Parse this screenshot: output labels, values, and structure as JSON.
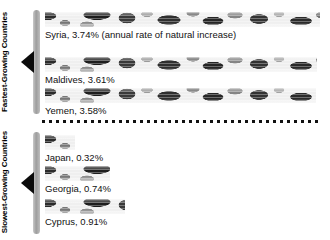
{
  "groups": [
    {
      "caption": "Fastest-Growing Countries"
    },
    {
      "caption": "Slowest-Growing Countries"
    }
  ],
  "rows": [
    {
      "label": "Syria, 3.74% (annual rate of natural increase)",
      "country": "Syria",
      "value": 3.74,
      "top": 12,
      "bar_width": 275
    },
    {
      "label": "Maldives, 3.61%",
      "country": "Maldives",
      "value": 3.61,
      "top": 57,
      "bar_width": 272
    },
    {
      "label": "Yemen, 3.58%",
      "country": "Yemen",
      "value": 3.58,
      "top": 88,
      "bar_width": 271
    },
    {
      "label": "Japan, 0.32%",
      "country": "Japan",
      "value": 0.32,
      "top": 135,
      "bar_width": 30
    },
    {
      "label": "Georgia, 0.74%",
      "country": "Georgia",
      "value": 0.74,
      "top": 166,
      "bar_width": 65
    },
    {
      "label": "Cyprus, 0.91%",
      "country": "Cyprus",
      "value": 0.91,
      "top": 199,
      "bar_width": 80
    }
  ],
  "chart_data": {
    "type": "bar",
    "title": "",
    "subtitle": "",
    "xlabel": "annual rate of natural increase",
    "ylabel": "",
    "orientation": "horizontal",
    "units": "percent",
    "grid": false,
    "legend": false,
    "annotations": [
      "annual rate of natural increase"
    ],
    "groups": [
      {
        "name": "Fastest-Growing Countries",
        "categories": [
          "Syria",
          "Maldives",
          "Yemen"
        ],
        "values": [
          3.74,
          3.61,
          3.58
        ]
      },
      {
        "name": "Slowest-Growing Countries",
        "categories": [
          "Japan",
          "Georgia",
          "Cyprus"
        ],
        "values": [
          0.32,
          0.74,
          0.91
        ]
      }
    ],
    "categories": [
      "Syria",
      "Maldives",
      "Yemen",
      "Japan",
      "Georgia",
      "Cyprus"
    ],
    "values": [
      3.74,
      3.61,
      3.58,
      0.32,
      0.74,
      0.91
    ],
    "xlim": [
      0,
      3.74
    ]
  },
  "colors": {
    "background": "#ffffff",
    "text": "#000000",
    "bracket": "#9d9d9d",
    "pointer": "#0b0b0b",
    "divider": "#111111"
  }
}
